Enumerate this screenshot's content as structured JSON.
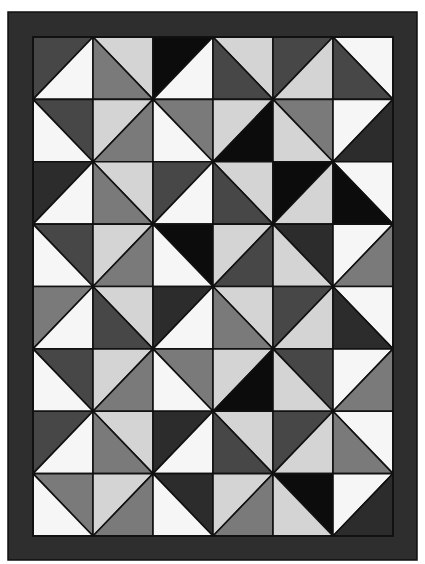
{
  "quilt": {
    "name": "half-square-triangle quilt",
    "border_color": "#2e2e2e",
    "seam_color": "#111111",
    "outer": {
      "x": 8,
      "y": 12,
      "w": 409,
      "h": 548
    },
    "inner": {
      "x": 33,
      "y": 37,
      "w": 360,
      "h": 499
    },
    "cols": 6,
    "rows": 8,
    "palette": {
      "white": "#f6f6f6",
      "light": "#d4d4d4",
      "mid": "#7a7a7a",
      "dark": "#474747",
      "darker": "#2c2c2c",
      "black": "#0c0c0c"
    },
    "blocks": [
      [
        {
          "diag": "/",
          "a": "dark",
          "b": "white"
        },
        {
          "diag": "\\",
          "a": "light",
          "b": "mid"
        },
        {
          "diag": "/",
          "a": "black",
          "b": "white"
        },
        {
          "diag": "\\",
          "a": "light",
          "b": "dark"
        },
        {
          "diag": "/",
          "a": "dark",
          "b": "light"
        },
        {
          "diag": "\\",
          "a": "white",
          "b": "dark"
        }
      ],
      [
        {
          "diag": "\\",
          "a": "dark",
          "b": "white"
        },
        {
          "diag": "/",
          "a": "light",
          "b": "mid"
        },
        {
          "diag": "\\",
          "a": "mid",
          "b": "white"
        },
        {
          "diag": "/",
          "a": "light",
          "b": "black"
        },
        {
          "diag": "\\",
          "a": "mid",
          "b": "light"
        },
        {
          "diag": "/",
          "a": "white",
          "b": "darker"
        }
      ],
      [
        {
          "diag": "/",
          "a": "darker",
          "b": "white"
        },
        {
          "diag": "\\",
          "a": "light",
          "b": "mid"
        },
        {
          "diag": "/",
          "a": "dark",
          "b": "white"
        },
        {
          "diag": "\\",
          "a": "light",
          "b": "dark"
        },
        {
          "diag": "/",
          "a": "black",
          "b": "light"
        },
        {
          "diag": "\\",
          "a": "white",
          "b": "black"
        }
      ],
      [
        {
          "diag": "\\",
          "a": "dark",
          "b": "white"
        },
        {
          "diag": "/",
          "a": "light",
          "b": "mid"
        },
        {
          "diag": "\\",
          "a": "black",
          "b": "white"
        },
        {
          "diag": "/",
          "a": "light",
          "b": "dark"
        },
        {
          "diag": "\\",
          "a": "darker",
          "b": "light"
        },
        {
          "diag": "/",
          "a": "white",
          "b": "mid"
        }
      ],
      [
        {
          "diag": "/",
          "a": "mid",
          "b": "white"
        },
        {
          "diag": "\\",
          "a": "light",
          "b": "dark"
        },
        {
          "diag": "/",
          "a": "darker",
          "b": "white"
        },
        {
          "diag": "\\",
          "a": "light",
          "b": "mid"
        },
        {
          "diag": "/",
          "a": "dark",
          "b": "light"
        },
        {
          "diag": "\\",
          "a": "white",
          "b": "darker"
        }
      ],
      [
        {
          "diag": "\\",
          "a": "dark",
          "b": "white"
        },
        {
          "diag": "/",
          "a": "light",
          "b": "mid"
        },
        {
          "diag": "\\",
          "a": "mid",
          "b": "white"
        },
        {
          "diag": "/",
          "a": "light",
          "b": "black"
        },
        {
          "diag": "\\",
          "a": "dark",
          "b": "light"
        },
        {
          "diag": "/",
          "a": "white",
          "b": "mid"
        }
      ],
      [
        {
          "diag": "/",
          "a": "dark",
          "b": "white"
        },
        {
          "diag": "\\",
          "a": "light",
          "b": "mid"
        },
        {
          "diag": "/",
          "a": "darker",
          "b": "white"
        },
        {
          "diag": "\\",
          "a": "light",
          "b": "dark"
        },
        {
          "diag": "/",
          "a": "dark",
          "b": "light"
        },
        {
          "diag": "\\",
          "a": "white",
          "b": "mid"
        }
      ],
      [
        {
          "diag": "\\",
          "a": "mid",
          "b": "white"
        },
        {
          "diag": "/",
          "a": "light",
          "b": "mid"
        },
        {
          "diag": "\\",
          "a": "darker",
          "b": "white"
        },
        {
          "diag": "/",
          "a": "light",
          "b": "mid"
        },
        {
          "diag": "\\",
          "a": "black",
          "b": "light"
        },
        {
          "diag": "/",
          "a": "white",
          "b": "darker"
        }
      ]
    ]
  }
}
